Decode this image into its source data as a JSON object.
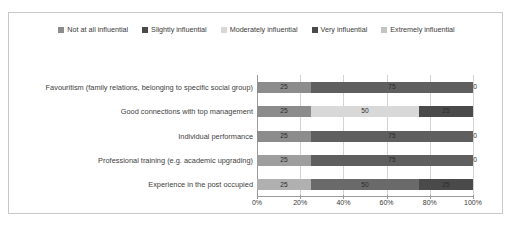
{
  "chart_data": {
    "type": "bar",
    "subtype": "stacked-horizontal-100pct",
    "title": "",
    "xlabel": "",
    "ylabel": "",
    "xlim": [
      0,
      100
    ],
    "xticks": [
      "0%",
      "20%",
      "40%",
      "60%",
      "80%",
      "100%"
    ],
    "xtick_values": [
      0,
      20,
      40,
      60,
      80,
      100
    ],
    "grid": true,
    "legend_position": "top-center",
    "categories": [
      "Favouritism (family relations, belonging to specific social group)",
      "Good connections with top management",
      "Individual performance",
      "Professional training (e.g. academic upgrading)",
      "Experience in the post occupied"
    ],
    "series": [
      {
        "name": "Not at all influential",
        "color": "#8c8c8c",
        "values": [
          25,
          25,
          25,
          25,
          25
        ]
      },
      {
        "name": "Slightly influential",
        "color": "#5f5f5f",
        "values": [
          75,
          0,
          75,
          75,
          0
        ]
      },
      {
        "name": "Moderately influential",
        "color": "#d8d8d8",
        "values": [
          0,
          50,
          0,
          0,
          50
        ]
      },
      {
        "name": "Very influential",
        "color": "#4a4a4a",
        "values": [
          0,
          25,
          0,
          0,
          25
        ]
      },
      {
        "name": "Extremely influential",
        "color": "#c4c4c4",
        "values": [
          0,
          0,
          0,
          0,
          0
        ]
      }
    ],
    "bars": [
      {
        "category": "Favouritism (family relations, belonging to specific social group)",
        "segments": [
          {
            "series": "Not at all influential",
            "value": 25,
            "label": "25",
            "color": "#8c8c8c"
          },
          {
            "series": "Slightly influential",
            "value": 75,
            "label": "75",
            "color": "#5f5f5f"
          },
          {
            "series": "Moderately influential",
            "value": 0,
            "label": "0",
            "color": "#d8d8d8",
            "edge_label": true
          }
        ]
      },
      {
        "category": "Good connections with top management",
        "segments": [
          {
            "series": "Not at all influential",
            "value": 25,
            "label": "25",
            "color": "#8c8c8c"
          },
          {
            "series": "Slightly influential",
            "value": 0,
            "label": "0",
            "color": "#9e9e9e"
          },
          {
            "series": "Moderately influential",
            "value": 50,
            "label": "50",
            "color": "#d8d8d8"
          },
          {
            "series": "Very influential",
            "value": 25,
            "label": "25",
            "color": "#4a4a4a"
          }
        ]
      },
      {
        "category": "Individual performance",
        "segments": [
          {
            "series": "Not at all influential",
            "value": 25,
            "label": "25",
            "color": "#8c8c8c"
          },
          {
            "series": "Slightly influential",
            "value": 75,
            "label": "75",
            "color": "#5f5f5f"
          },
          {
            "series": "Moderately influential",
            "value": 0,
            "label": "0",
            "color": "#d8d8d8",
            "edge_label": true
          }
        ]
      },
      {
        "category": "Professional training (e.g. academic upgrading)",
        "segments": [
          {
            "series": "Not at all influential",
            "value": 25,
            "label": "25",
            "color": "#9e9e9e"
          },
          {
            "series": "Slightly influential",
            "value": 75,
            "label": "75",
            "color": "#5f5f5f"
          },
          {
            "series": "Moderately influential",
            "value": 0,
            "label": "0",
            "color": "#d8d8d8",
            "edge_label": true
          }
        ]
      },
      {
        "category": "Experience in the post occupied",
        "segments": [
          {
            "series": "Not at all influential",
            "value": 25,
            "label": "25",
            "color": "#b0b0b0"
          },
          {
            "series": "Slightly influential",
            "value": 50,
            "label": "50",
            "color": "#6a6a6a"
          },
          {
            "series": "Very influential",
            "value": 25,
            "label": "25",
            "color": "#4a4a4a"
          }
        ]
      }
    ]
  },
  "legend": {
    "items": [
      {
        "label": "Not at all influential",
        "color": "#8c8c8c"
      },
      {
        "label": "Slightly influential",
        "color": "#4a4a4a"
      },
      {
        "label": "Moderately influential",
        "color": "#d8d8d8"
      },
      {
        "label": "Very influential",
        "color": "#4a4a4a"
      },
      {
        "label": "Extremely influential",
        "color": "#c4c4c4"
      }
    ]
  }
}
